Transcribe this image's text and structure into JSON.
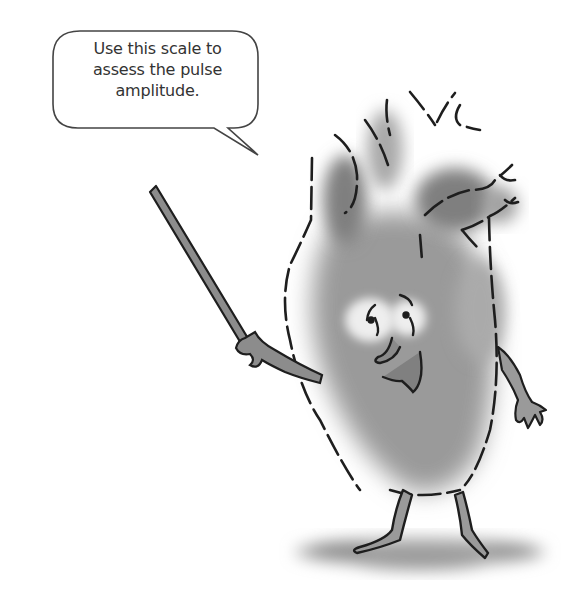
{
  "speech_bubble": {
    "lines": [
      "Use this scale to",
      "assess the pulse",
      "amplitude."
    ]
  },
  "illustration": {
    "subject": "cartoon-heart-character",
    "holding": "pointer-stick",
    "colors": {
      "outline": "#222222",
      "fill": "#8c8c8c",
      "shadow": "#9a9a9a",
      "background": "#ffffff"
    }
  }
}
